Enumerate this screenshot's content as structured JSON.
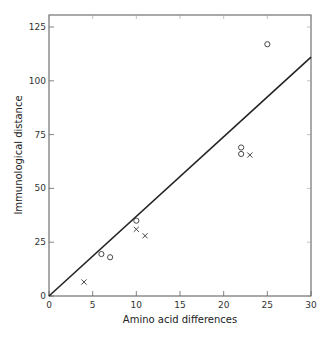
{
  "chart_data": {
    "type": "scatter",
    "title": "",
    "xlabel": "Amino acid differences",
    "ylabel": "Immunological distance",
    "xlim": [
      0,
      30
    ],
    "ylim": [
      0,
      130
    ],
    "xticks": [
      0,
      5,
      10,
      15,
      20,
      25,
      30
    ],
    "yticks": [
      0,
      25,
      50,
      75,
      100,
      125
    ],
    "grid": false,
    "legend": null,
    "series": [
      {
        "name": "circles",
        "marker": "o",
        "points": [
          {
            "x": 6,
            "y": 19.5
          },
          {
            "x": 7,
            "y": 18
          },
          {
            "x": 10,
            "y": 35
          },
          {
            "x": 22,
            "y": 69
          },
          {
            "x": 22,
            "y": 66
          },
          {
            "x": 25,
            "y": 117
          }
        ]
      },
      {
        "name": "crosses",
        "marker": "x",
        "points": [
          {
            "x": 4,
            "y": 6.5
          },
          {
            "x": 10,
            "y": 31
          },
          {
            "x": 11,
            "y": 28
          },
          {
            "x": 23,
            "y": 65.5
          }
        ]
      }
    ],
    "fit_line": {
      "x": [
        0,
        30
      ],
      "y": [
        0,
        111
      ]
    }
  }
}
